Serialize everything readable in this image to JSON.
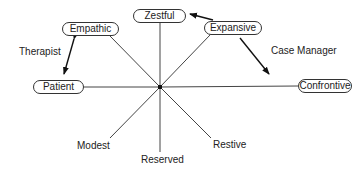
{
  "diagram": {
    "nodes": {
      "zestful": "Zestful",
      "empathic": "Empathic",
      "expansive": "Expansive",
      "patient": "Patient",
      "confrontive": "Confrontive",
      "modest": "Modest",
      "reserved": "Reserved",
      "restive": "Restive"
    },
    "roles": {
      "therapist": "Therapist",
      "case_manager": "Case Manager"
    },
    "arrows": [
      {
        "from": "Empathic",
        "to": "Patient",
        "label": "Therapist",
        "bidirectional": true
      },
      {
        "from": "Expansive",
        "to": "Zestful",
        "label": "",
        "bidirectional": false
      },
      {
        "from": "Expansive",
        "to": "Confrontive",
        "label": "Case Manager",
        "bidirectional": false
      }
    ]
  }
}
